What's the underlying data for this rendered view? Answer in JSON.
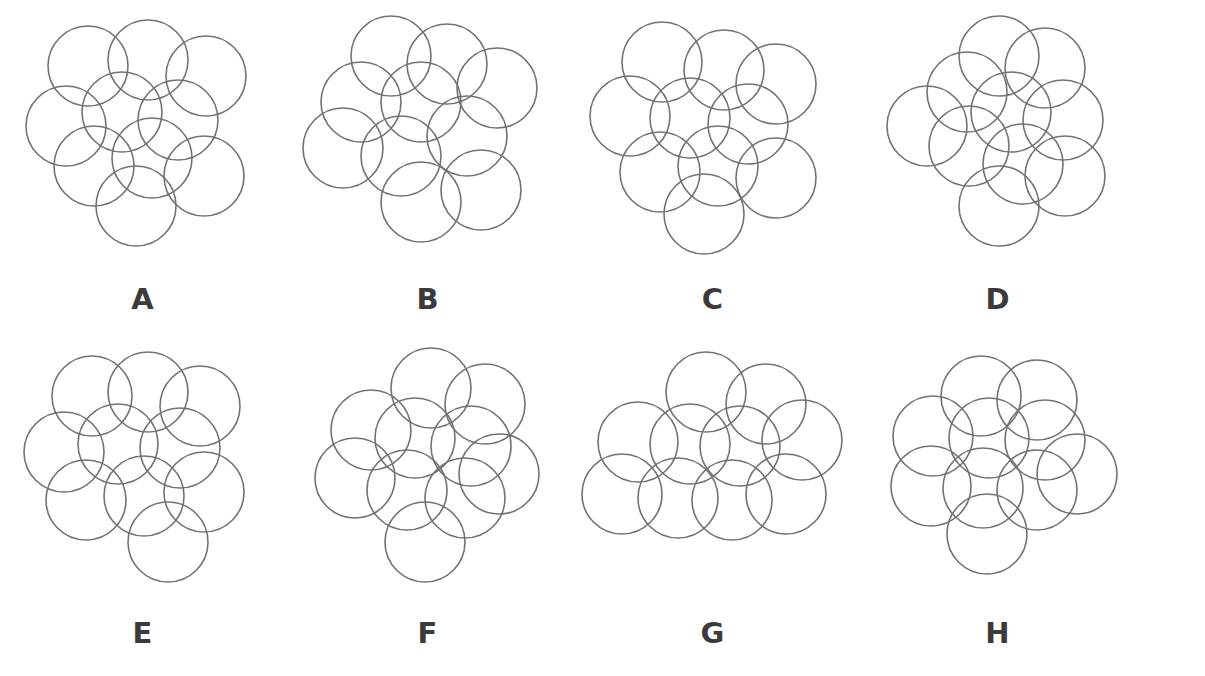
{
  "figure": {
    "background_color": "#ffffff",
    "stroke_color": "#727272",
    "label_color": "#3b3b3b",
    "stroke_width": 1.6,
    "panel_count": 8,
    "circles_per_panel": 10,
    "circle_radius": 40
  },
  "rows": [
    {
      "name": "top-row",
      "panels": [
        "A",
        "B",
        "C",
        "D"
      ]
    },
    {
      "name": "bottom-row",
      "panels": [
        "E",
        "F",
        "G",
        "H"
      ]
    }
  ],
  "panels": [
    {
      "label": "A",
      "offset_x": 18,
      "offset_y": 8,
      "radius": 40,
      "circles": [
        {
          "cx": 70,
          "cy": 58
        },
        {
          "cx": 130,
          "cy": 52
        },
        {
          "cx": 188,
          "cy": 68
        },
        {
          "cx": 48,
          "cy": 118
        },
        {
          "cx": 104,
          "cy": 104
        },
        {
          "cx": 160,
          "cy": 112
        },
        {
          "cx": 76,
          "cy": 158
        },
        {
          "cx": 134,
          "cy": 150
        },
        {
          "cx": 186,
          "cy": 168
        },
        {
          "cx": 118,
          "cy": 198
        }
      ]
    },
    {
      "label": "B",
      "offset_x": 14,
      "offset_y": 6,
      "radius": 40,
      "circles": [
        {
          "cx": 92,
          "cy": 50
        },
        {
          "cx": 148,
          "cy": 58
        },
        {
          "cx": 62,
          "cy": 96
        },
        {
          "cx": 122,
          "cy": 96
        },
        {
          "cx": 198,
          "cy": 82
        },
        {
          "cx": 44,
          "cy": 142
        },
        {
          "cx": 102,
          "cy": 150
        },
        {
          "cx": 168,
          "cy": 130
        },
        {
          "cx": 122,
          "cy": 196
        },
        {
          "cx": 182,
          "cy": 184
        }
      ]
    },
    {
      "label": "C",
      "offset_x": 16,
      "offset_y": 8,
      "radius": 40,
      "circles": [
        {
          "cx": 76,
          "cy": 54
        },
        {
          "cx": 138,
          "cy": 62
        },
        {
          "cx": 190,
          "cy": 76
        },
        {
          "cx": 44,
          "cy": 108
        },
        {
          "cx": 104,
          "cy": 110
        },
        {
          "cx": 162,
          "cy": 116
        },
        {
          "cx": 74,
          "cy": 164
        },
        {
          "cx": 132,
          "cy": 158
        },
        {
          "cx": 190,
          "cy": 170
        },
        {
          "cx": 118,
          "cy": 206
        }
      ]
    },
    {
      "label": "D",
      "offset_x": 12,
      "offset_y": 10,
      "radius": 40,
      "circles": [
        {
          "cx": 132,
          "cy": 46
        },
        {
          "cx": 178,
          "cy": 58
        },
        {
          "cx": 100,
          "cy": 82
        },
        {
          "cx": 60,
          "cy": 116
        },
        {
          "cx": 144,
          "cy": 102
        },
        {
          "cx": 196,
          "cy": 110
        },
        {
          "cx": 102,
          "cy": 136
        },
        {
          "cx": 156,
          "cy": 154
        },
        {
          "cx": 198,
          "cy": 166
        },
        {
          "cx": 132,
          "cy": 196
        }
      ]
    },
    {
      "label": "E",
      "offset_x": 16,
      "offset_y": 6,
      "radius": 40,
      "circles": [
        {
          "cx": 76,
          "cy": 52
        },
        {
          "cx": 132,
          "cy": 48
        },
        {
          "cx": 184,
          "cy": 62
        },
        {
          "cx": 48,
          "cy": 108
        },
        {
          "cx": 102,
          "cy": 100
        },
        {
          "cx": 164,
          "cy": 104
        },
        {
          "cx": 70,
          "cy": 156
        },
        {
          "cx": 128,
          "cy": 152
        },
        {
          "cx": 188,
          "cy": 148
        },
        {
          "cx": 152,
          "cy": 198
        }
      ]
    },
    {
      "label": "F",
      "offset_x": 18,
      "offset_y": 4,
      "radius": 40,
      "circles": [
        {
          "cx": 128,
          "cy": 46
        },
        {
          "cx": 182,
          "cy": 62
        },
        {
          "cx": 68,
          "cy": 88
        },
        {
          "cx": 112,
          "cy": 96
        },
        {
          "cx": 168,
          "cy": 104
        },
        {
          "cx": 52,
          "cy": 136
        },
        {
          "cx": 104,
          "cy": 148
        },
        {
          "cx": 162,
          "cy": 156
        },
        {
          "cx": 196,
          "cy": 132
        },
        {
          "cx": 122,
          "cy": 200
        }
      ]
    },
    {
      "label": "G",
      "offset_x": 4,
      "offset_y": 10,
      "radius": 40,
      "circles": [
        {
          "cx": 132,
          "cy": 44
        },
        {
          "cx": 192,
          "cy": 56
        },
        {
          "cx": 64,
          "cy": 94
        },
        {
          "cx": 116,
          "cy": 96
        },
        {
          "cx": 166,
          "cy": 98
        },
        {
          "cx": 228,
          "cy": 92
        },
        {
          "cx": 48,
          "cy": 146
        },
        {
          "cx": 104,
          "cy": 150
        },
        {
          "cx": 158,
          "cy": 152
        },
        {
          "cx": 212,
          "cy": 146
        }
      ]
    },
    {
      "label": "H",
      "offset_x": 16,
      "offset_y": 6,
      "radius": 40,
      "circles": [
        {
          "cx": 110,
          "cy": 52
        },
        {
          "cx": 166,
          "cy": 56
        },
        {
          "cx": 62,
          "cy": 92
        },
        {
          "cx": 118,
          "cy": 94
        },
        {
          "cx": 174,
          "cy": 96
        },
        {
          "cx": 206,
          "cy": 130
        },
        {
          "cx": 60,
          "cy": 142
        },
        {
          "cx": 112,
          "cy": 144
        },
        {
          "cx": 166,
          "cy": 146
        },
        {
          "cx": 116,
          "cy": 190
        }
      ]
    }
  ]
}
